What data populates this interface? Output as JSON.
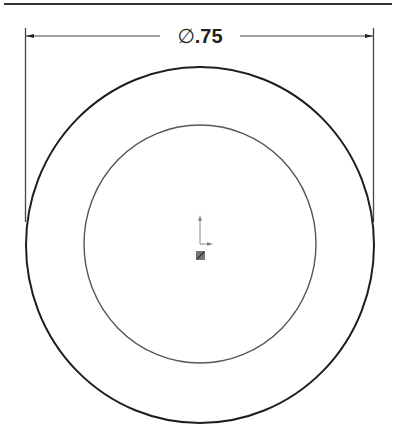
{
  "drawing": {
    "dimension": {
      "symbol": "∅",
      "value": ".75",
      "type": "diameter"
    },
    "shapes": {
      "outer_circle": {
        "cx": 200,
        "cy": 245,
        "rx": 174,
        "ry": 178,
        "color": "#1e1e1e"
      },
      "inner_circle": {
        "cx": 200,
        "cy": 244,
        "rx": 116,
        "ry": 119,
        "color": "#555555"
      }
    },
    "origin_icon": "coordinate-origin-icon",
    "colors": {
      "line": "#1e1e1e",
      "background": "#ffffff"
    }
  }
}
